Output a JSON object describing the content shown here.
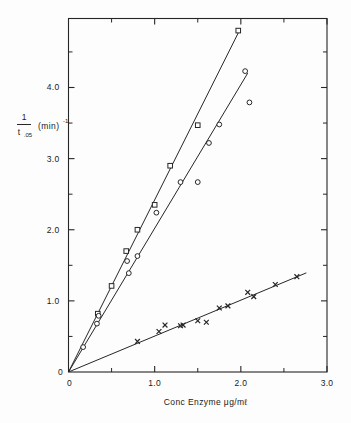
{
  "chart_data": {
    "type": "scatter",
    "title": "",
    "xlabel": "Conc Enzyme  μg/mℓ",
    "ylabel_numerator": "1",
    "ylabel_denominator": "t",
    "ylabel_denominator_sub": ".05",
    "ylabel_units": "(min)",
    "ylabel_units_exp": "-1",
    "xlim": [
      0,
      3.0
    ],
    "ylim": [
      0,
      4.97
    ],
    "grid": false,
    "legend": "none",
    "xticks": [
      "0",
      "1.0",
      "2.0",
      "3.0"
    ],
    "xtick_values": [
      0,
      1.0,
      2.0,
      3.0
    ],
    "xminor_values": [
      0.5,
      1.5,
      2.5
    ],
    "yticks": [
      "0",
      "1.0",
      "2.0",
      "3.0",
      "4.0"
    ],
    "ytick_values": [
      0,
      1.0,
      2.0,
      3.0,
      4.0
    ],
    "yminor_values": [
      0.5,
      1.5,
      2.5,
      3.5,
      4.5
    ],
    "origin_label": "0",
    "series": [
      {
        "name": "series-squares",
        "marker": "open-square",
        "fit_slope": 2.42,
        "fit_intercept": 0,
        "fit_x_range": [
          0,
          1.98
        ],
        "points": [
          [
            0.34,
            0.82
          ],
          [
            0.5,
            1.21
          ],
          [
            0.67,
            1.7
          ],
          [
            0.8,
            2.0
          ],
          [
            1.0,
            2.35
          ],
          [
            1.18,
            2.9
          ],
          [
            1.5,
            3.47
          ],
          [
            1.97,
            4.8
          ]
        ]
      },
      {
        "name": "series-circles",
        "marker": "open-circle",
        "fit_slope": 2.02,
        "fit_intercept": 0,
        "fit_x_range": [
          0,
          2.08
        ],
        "points": [
          [
            0.17,
            0.35
          ],
          [
            0.33,
            0.68
          ],
          [
            0.35,
            0.79
          ],
          [
            0.68,
            1.56
          ],
          [
            0.7,
            1.39
          ],
          [
            0.8,
            1.63
          ],
          [
            1.02,
            2.24
          ],
          [
            1.3,
            2.67
          ],
          [
            1.5,
            2.67
          ],
          [
            1.63,
            3.22
          ],
          [
            1.75,
            3.48
          ],
          [
            2.05,
            4.23
          ],
          [
            2.1,
            3.79
          ]
        ]
      },
      {
        "name": "series-crosses",
        "marker": "cross",
        "fit_slope": 0.505,
        "fit_intercept": 0,
        "fit_x_range": [
          0,
          2.76
        ],
        "points": [
          [
            0.8,
            0.43
          ],
          [
            1.05,
            0.57
          ],
          [
            1.12,
            0.66
          ],
          [
            1.3,
            0.65
          ],
          [
            1.33,
            0.66
          ],
          [
            1.5,
            0.72
          ],
          [
            1.6,
            0.7
          ],
          [
            1.75,
            0.9
          ],
          [
            1.85,
            0.93
          ],
          [
            2.08,
            1.12
          ],
          [
            2.15,
            1.06
          ],
          [
            2.4,
            1.23
          ],
          [
            2.65,
            1.34
          ]
        ]
      }
    ]
  }
}
